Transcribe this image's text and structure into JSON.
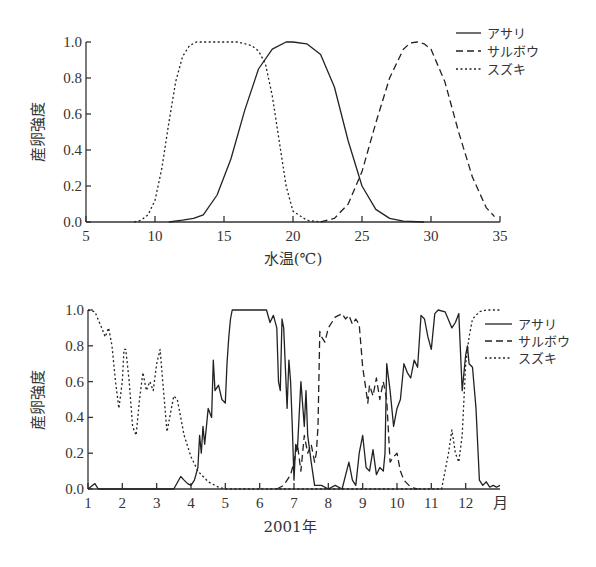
{
  "chart_data": [
    {
      "type": "line",
      "title": "",
      "xlabel": "水温(℃)",
      "ylabel": "産卵強度",
      "xlim": [
        5,
        35
      ],
      "ylim": [
        0.0,
        1.0
      ],
      "xticks": [
        "5",
        "10",
        "15",
        "20",
        "25",
        "30",
        "35"
      ],
      "yticks": [
        "0.0",
        "0.2",
        "0.4",
        "0.6",
        "0.8",
        "1.0"
      ],
      "grid": false,
      "legend_position": "top-right",
      "legend": [
        "アサリ",
        "サルボウ",
        "スズキ"
      ],
      "series": [
        {
          "name": "アサリ",
          "style": "solid",
          "x": [
            11,
            12,
            12.8,
            13.5,
            14.5,
            15.5,
            16.5,
            17.5,
            18.5,
            19.5,
            20,
            21,
            22,
            23,
            24,
            25,
            26,
            27,
            28,
            29.5
          ],
          "values": [
            0,
            0.01,
            0.02,
            0.04,
            0.15,
            0.35,
            0.62,
            0.85,
            0.96,
            1.0,
            1.0,
            0.99,
            0.93,
            0.75,
            0.45,
            0.2,
            0.07,
            0.02,
            0.005,
            0
          ]
        },
        {
          "name": "サルボウ",
          "style": "dashed",
          "x": [
            22,
            23,
            24,
            25,
            26,
            27,
            28,
            28.5,
            29,
            29.5,
            30,
            31,
            32,
            33,
            34,
            34.6
          ],
          "values": [
            0,
            0.02,
            0.1,
            0.28,
            0.55,
            0.8,
            0.96,
            0.995,
            1.0,
            0.99,
            0.96,
            0.78,
            0.5,
            0.25,
            0.08,
            0.03
          ]
        },
        {
          "name": "スズキ",
          "style": "dotted",
          "x": [
            8.5,
            9,
            9.5,
            10,
            10.5,
            11,
            11.5,
            12,
            12.5,
            13,
            14,
            15,
            16,
            17,
            17.5,
            18,
            18.5,
            19,
            19.5,
            20,
            21,
            22
          ],
          "values": [
            0,
            0.01,
            0.04,
            0.12,
            0.3,
            0.55,
            0.78,
            0.92,
            0.98,
            1.0,
            1.0,
            1.0,
            1.0,
            0.98,
            0.95,
            0.88,
            0.7,
            0.45,
            0.2,
            0.06,
            0.01,
            0
          ]
        }
      ]
    },
    {
      "type": "line",
      "title": "",
      "xlabel": "2001年",
      "ylabel": "産卵強度",
      "xlim": [
        1,
        13
      ],
      "ylim": [
        0.0,
        1.0
      ],
      "xticks": [
        "1",
        "2",
        "3",
        "4",
        "5",
        "6",
        "7",
        "8",
        "9",
        "10",
        "11",
        "12",
        "月"
      ],
      "yticks": [
        "0.0",
        "0.2",
        "0.4",
        "0.6",
        "0.8",
        "1.0"
      ],
      "grid": false,
      "legend_position": "right",
      "legend": [
        "アサリ",
        "サルボウ",
        "スズキ"
      ],
      "series": [
        {
          "name": "アサリ",
          "style": "solid",
          "x": [
            1,
            1.2,
            1.3,
            1.4,
            1.6,
            3.5,
            3.7,
            3.8,
            3.9,
            4.0,
            4.1,
            4.2,
            4.25,
            4.3,
            4.35,
            4.4,
            4.5,
            4.6,
            4.65,
            4.7,
            4.8,
            4.9,
            5.0,
            5.05,
            5.1,
            5.15,
            5.2,
            5.3,
            5.4,
            6.2,
            6.3,
            6.4,
            6.5,
            6.55,
            6.6,
            6.65,
            6.7,
            6.8,
            6.85,
            6.9,
            6.95,
            7.0,
            7.05,
            7.1,
            7.2,
            7.3,
            7.35,
            7.4,
            7.5,
            7.6,
            7.8,
            8.0,
            8.2,
            8.4,
            8.6,
            8.7,
            8.8,
            8.9,
            9.0,
            9.1,
            9.2,
            9.3,
            9.4,
            9.5,
            9.6,
            9.65,
            9.7,
            9.8,
            9.9,
            10.0,
            10.1,
            10.2,
            10.3,
            10.4,
            10.5,
            10.6,
            10.7,
            10.8,
            10.9,
            11.0,
            11.1,
            11.2,
            11.4,
            11.6,
            11.7,
            11.8,
            11.9,
            12.0,
            12.05,
            12.1,
            12.2,
            12.3,
            12.35,
            12.4,
            12.5,
            12.6,
            12.7,
            12.8,
            12.9,
            13.0
          ],
          "values": [
            0,
            0.03,
            0,
            0,
            0,
            0,
            0.07,
            0.05,
            0.03,
            0.02,
            0.05,
            0.12,
            0.3,
            0.2,
            0.35,
            0.25,
            0.45,
            0.4,
            0.72,
            0.55,
            0.58,
            0.5,
            0.48,
            0.7,
            0.85,
            0.95,
            1.0,
            1.0,
            1.0,
            1.0,
            0.93,
            0.97,
            0.9,
            0.6,
            0.55,
            0.95,
            0.9,
            0.45,
            0.72,
            0.6,
            0.35,
            0.05,
            0.25,
            0.22,
            0.6,
            0.35,
            0.55,
            0.3,
            0.15,
            0.02,
            0.02,
            0,
            0.02,
            0,
            0.15,
            0.05,
            0.02,
            0.2,
            0.3,
            0.12,
            0.1,
            0.22,
            0.08,
            0.12,
            0.1,
            0.2,
            0.7,
            0.55,
            0.35,
            0.45,
            0.5,
            0.7,
            0.65,
            0.62,
            0.72,
            0.68,
            0.97,
            0.95,
            0.85,
            0.78,
            0.98,
            1.0,
            0.99,
            0.9,
            0.93,
            0.98,
            0.55,
            0.75,
            0.8,
            0.7,
            0.68,
            0.45,
            0.25,
            0.05,
            0.02,
            0.04,
            0.01,
            0.02,
            0.01,
            0.02
          ]
        },
        {
          "name": "サルボウ",
          "style": "dashed",
          "x": [
            6.5,
            6.7,
            6.9,
            7.0,
            7.1,
            7.2,
            7.3,
            7.4,
            7.5,
            7.6,
            7.65,
            7.7,
            7.75,
            7.8,
            7.9,
            8.0,
            8.2,
            8.4,
            8.5,
            8.6,
            8.7,
            8.8,
            8.9,
            9.0,
            9.1,
            9.15,
            9.2,
            9.3,
            9.4,
            9.5,
            9.6,
            9.7,
            9.8,
            9.9,
            10.0,
            10.1,
            10.2,
            10.4,
            10.6
          ],
          "values": [
            0,
            0.02,
            0.08,
            0.15,
            0.25,
            0.1,
            0.3,
            0.2,
            0.25,
            0.15,
            0.2,
            0.35,
            0.88,
            0.85,
            0.82,
            0.9,
            0.96,
            0.98,
            0.95,
            0.97,
            0.92,
            0.95,
            0.92,
            0.68,
            0.55,
            0.48,
            0.58,
            0.52,
            0.62,
            0.5,
            0.6,
            0.5,
            0.15,
            0.18,
            0.2,
            0.1,
            0.05,
            0.01,
            0
          ]
        },
        {
          "name": "スズキ",
          "style": "dotted",
          "x": [
            1,
            1.2,
            1.4,
            1.5,
            1.6,
            1.7,
            1.8,
            1.9,
            2.0,
            2.05,
            2.1,
            2.2,
            2.3,
            2.4,
            2.5,
            2.6,
            2.7,
            2.8,
            2.9,
            3.0,
            3.1,
            3.2,
            3.3,
            3.4,
            3.5,
            3.6,
            3.7,
            3.8,
            4.0,
            4.2,
            4.5,
            4.8,
            5.0,
            11.3,
            11.5,
            11.6,
            11.7,
            11.8,
            11.9,
            12.0,
            12.1,
            12.2,
            12.4,
            12.6,
            13.0
          ],
          "values": [
            1.0,
            0.99,
            0.9,
            0.85,
            0.9,
            0.8,
            0.6,
            0.45,
            0.6,
            0.78,
            0.78,
            0.6,
            0.35,
            0.3,
            0.5,
            0.65,
            0.55,
            0.6,
            0.55,
            0.7,
            0.78,
            0.55,
            0.32,
            0.42,
            0.52,
            0.5,
            0.4,
            0.3,
            0.18,
            0.1,
            0.04,
            0.01,
            0,
            0,
            0.2,
            0.33,
            0.2,
            0.15,
            0.3,
            0.7,
            0.85,
            0.95,
            0.99,
            1.0,
            1.0
          ]
        }
      ]
    }
  ],
  "charts": {
    "top": {
      "ylabel": "産卵強度",
      "xlabel": "水温(℃)",
      "legend": {
        "items": [
          {
            "label": "アサリ"
          },
          {
            "label": "サルボウ"
          },
          {
            "label": "スズキ"
          }
        ]
      }
    },
    "bottom": {
      "ylabel": "産卵強度",
      "xlabel": "2001年",
      "legend": {
        "items": [
          {
            "label": "アサリ"
          },
          {
            "label": "サルボウ"
          },
          {
            "label": "スズキ"
          }
        ]
      }
    }
  }
}
